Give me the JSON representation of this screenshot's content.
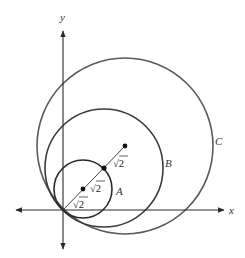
{
  "diagram": {
    "axes": {
      "x_label": "x",
      "y_label": "y"
    },
    "circles": [
      {
        "name": "A",
        "label": "A",
        "color": "#2a2a2a"
      },
      {
        "name": "B",
        "label": "B",
        "color": "#3a3a3a"
      },
      {
        "name": "C",
        "label": "C",
        "color": "#5a5a5a"
      }
    ],
    "segment_labels": [
      "√2",
      "√2",
      "√2"
    ],
    "colors": {
      "axis": "#2b2b2b",
      "text": "#333333",
      "background": "#ffffff"
    }
  }
}
